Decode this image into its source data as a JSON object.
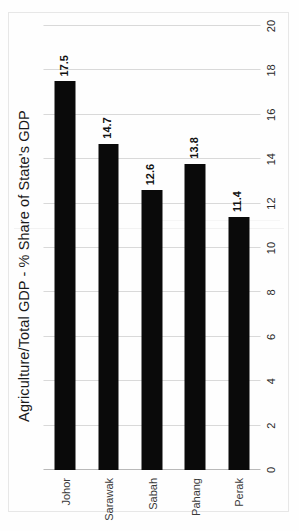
{
  "chart_data": {
    "type": "bar",
    "orientation": "horizontal",
    "title": "Agriculture/Total GDP - % Share of State's GDP",
    "xlabel": "",
    "ylabel": "",
    "categories": [
      "Johor",
      "Sarawak",
      "Sabah",
      "Pahang",
      "Perak"
    ],
    "values": [
      17.5,
      14.7,
      12.6,
      13.8,
      11.4
    ],
    "data_labels": [
      "17.5",
      "14.7",
      "12.6",
      "13.8",
      "11.4"
    ],
    "axis_ticks": [
      "0",
      "2",
      "4",
      "6",
      "8",
      "10",
      "12",
      "14",
      "16",
      "18",
      "20"
    ],
    "axis_tick_values": [
      0,
      2,
      4,
      6,
      8,
      10,
      12,
      14,
      16,
      18,
      20
    ],
    "ylim": [
      0,
      20
    ],
    "grid": true,
    "legend": false,
    "bar_color": "#0a0a0a",
    "gridline_color": "#d9d9d9",
    "background_color": "#ffffff",
    "series": [
      {
        "name": "Agriculture/Total GDP - % Share of State's GDP",
        "values": [
          17.5,
          14.7,
          12.6,
          13.8,
          11.4
        ]
      }
    ]
  },
  "page": {
    "rotation": "-90",
    "note": ""
  }
}
